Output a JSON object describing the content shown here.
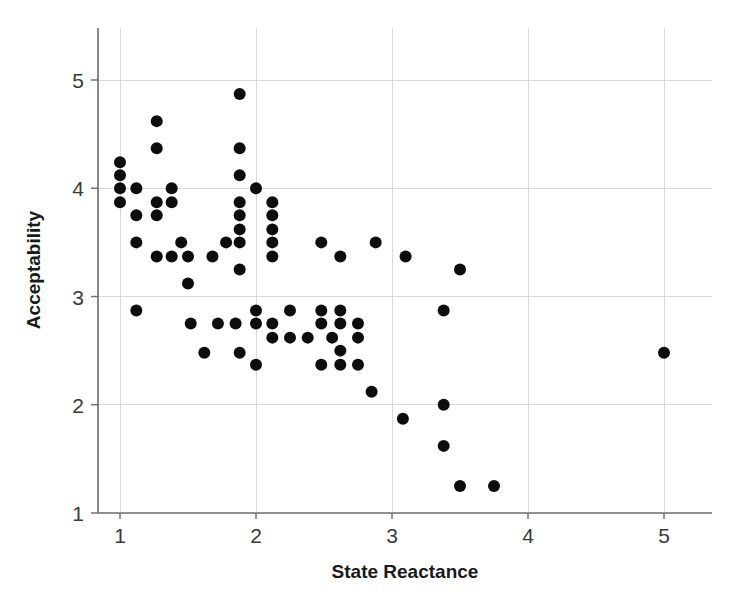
{
  "chart_data": {
    "type": "scatter",
    "title": "",
    "subtitle": "",
    "xlabel": "State Reactance",
    "ylabel": "Acceptability",
    "xlim": [
      0.75,
      5.3
    ],
    "ylim": [
      1.0,
      5.3
    ],
    "xticks": [
      1,
      2,
      3,
      4,
      5
    ],
    "yticks": [
      1,
      2,
      3,
      4,
      5
    ],
    "xticklabels": [
      "1",
      "2",
      "3",
      "4",
      "5"
    ],
    "yticklabels": [
      "1",
      "2",
      "3",
      "4",
      "5"
    ],
    "grid": true,
    "grid_color": "#d9d9d9",
    "legend": false,
    "legend_position": "none",
    "marker": "circle",
    "marker_color": "#0d0d0d",
    "marker_size": 6,
    "n_points": 76,
    "points": [
      [
        1.0,
        4.24
      ],
      [
        1.0,
        4.12
      ],
      [
        1.0,
        4.0
      ],
      [
        1.0,
        3.87
      ],
      [
        1.12,
        4.0
      ],
      [
        1.12,
        3.75
      ],
      [
        1.12,
        3.5
      ],
      [
        1.12,
        2.87
      ],
      [
        1.27,
        4.62
      ],
      [
        1.27,
        4.37
      ],
      [
        1.27,
        3.87
      ],
      [
        1.27,
        3.75
      ],
      [
        1.27,
        3.37
      ],
      [
        1.38,
        4.0
      ],
      [
        1.38,
        3.87
      ],
      [
        1.38,
        3.37
      ],
      [
        1.45,
        3.5
      ],
      [
        1.5,
        3.37
      ],
      [
        1.5,
        3.12
      ],
      [
        1.52,
        2.75
      ],
      [
        1.62,
        2.48
      ],
      [
        1.68,
        3.37
      ],
      [
        1.72,
        2.75
      ],
      [
        1.78,
        3.5
      ],
      [
        1.85,
        2.75
      ],
      [
        1.88,
        4.87
      ],
      [
        1.88,
        4.37
      ],
      [
        1.88,
        4.12
      ],
      [
        1.88,
        3.87
      ],
      [
        1.88,
        3.75
      ],
      [
        1.88,
        3.62
      ],
      [
        1.88,
        3.5
      ],
      [
        1.88,
        3.25
      ],
      [
        1.88,
        2.48
      ],
      [
        2.0,
        4.0
      ],
      [
        2.0,
        2.87
      ],
      [
        2.0,
        2.75
      ],
      [
        2.0,
        2.37
      ],
      [
        2.12,
        3.87
      ],
      [
        2.12,
        3.75
      ],
      [
        2.12,
        3.62
      ],
      [
        2.12,
        3.5
      ],
      [
        2.12,
        3.37
      ],
      [
        2.12,
        2.75
      ],
      [
        2.12,
        2.62
      ],
      [
        2.25,
        2.87
      ],
      [
        2.25,
        2.62
      ],
      [
        2.38,
        2.62
      ],
      [
        2.48,
        3.5
      ],
      [
        2.48,
        2.87
      ],
      [
        2.48,
        2.75
      ],
      [
        2.48,
        2.37
      ],
      [
        2.56,
        2.62
      ],
      [
        2.62,
        3.37
      ],
      [
        2.62,
        2.87
      ],
      [
        2.62,
        2.75
      ],
      [
        2.62,
        2.5
      ],
      [
        2.62,
        2.37
      ],
      [
        2.75,
        2.75
      ],
      [
        2.75,
        2.62
      ],
      [
        2.75,
        2.37
      ],
      [
        2.85,
        2.12
      ],
      [
        2.88,
        3.5
      ],
      [
        3.08,
        1.87
      ],
      [
        3.1,
        3.37
      ],
      [
        3.38,
        2.87
      ],
      [
        3.38,
        2.0
      ],
      [
        3.38,
        1.62
      ],
      [
        3.5,
        3.25
      ],
      [
        3.5,
        1.25
      ],
      [
        3.75,
        1.25
      ],
      [
        5.0,
        2.48
      ]
    ]
  },
  "axes": {
    "x_title": "State Reactance",
    "y_title": "Acceptability"
  }
}
